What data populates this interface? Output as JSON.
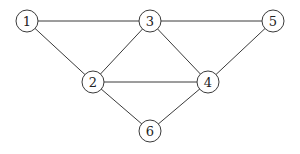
{
  "diagram": {
    "type": "undirected-graph",
    "node_radius": 11,
    "colors": {
      "background": "#ffffff",
      "stroke": "#3a3a3a",
      "label": "#222222"
    },
    "nodes": [
      {
        "id": "1",
        "label": "1",
        "x": 27,
        "y": 21
      },
      {
        "id": "2",
        "label": "2",
        "x": 93,
        "y": 82
      },
      {
        "id": "3",
        "label": "3",
        "x": 150,
        "y": 21
      },
      {
        "id": "4",
        "label": "4",
        "x": 208,
        "y": 82
      },
      {
        "id": "5",
        "label": "5",
        "x": 273,
        "y": 21
      },
      {
        "id": "6",
        "label": "6",
        "x": 150,
        "y": 131
      }
    ],
    "edges": [
      {
        "from": "1",
        "to": "3"
      },
      {
        "from": "1",
        "to": "2"
      },
      {
        "from": "2",
        "to": "3"
      },
      {
        "from": "3",
        "to": "5"
      },
      {
        "from": "3",
        "to": "4"
      },
      {
        "from": "2",
        "to": "4"
      },
      {
        "from": "4",
        "to": "5"
      },
      {
        "from": "2",
        "to": "6"
      },
      {
        "from": "4",
        "to": "6"
      }
    ]
  }
}
